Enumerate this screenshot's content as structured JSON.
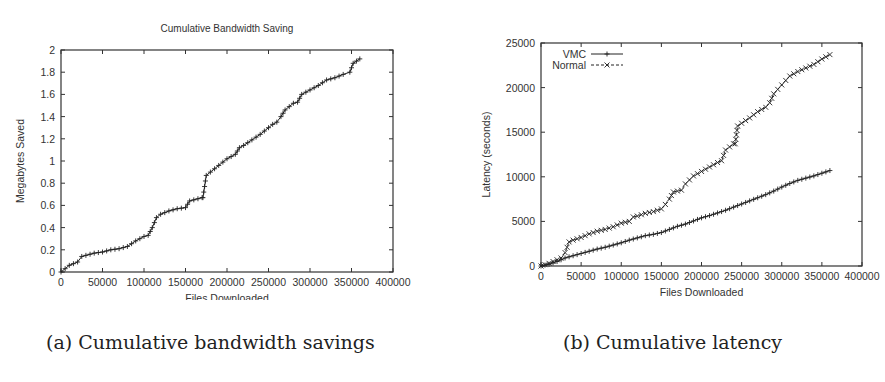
{
  "chart_data": [
    {
      "id": "a",
      "type": "line",
      "title": "Cumulative Bandwidth Saving",
      "xlabel": "Files Downloaded",
      "ylabel": "Megabytes Saved",
      "xlim": [
        0,
        400000
      ],
      "ylim": [
        0,
        2
      ],
      "xticks": [
        0,
        50000,
        100000,
        150000,
        200000,
        250000,
        300000,
        350000,
        400000
      ],
      "yticks": [
        0,
        0.2,
        0.4,
        0.6,
        0.8,
        1,
        1.2,
        1.4,
        1.6,
        1.8,
        2
      ],
      "ytick_labels": [
        "0",
        "0.2",
        "0.4",
        "0.6",
        "0.8",
        "1",
        "1.2",
        "1.4",
        "1.6",
        "1.8",
        "2"
      ],
      "grid": false,
      "legend": null,
      "series": [
        {
          "name": "Bandwidth Saved",
          "marker": "+",
          "dash": "solid",
          "x": [
            0,
            5000,
            10000,
            20000,
            25000,
            30000,
            40000,
            50000,
            60000,
            70000,
            80000,
            90000,
            100000,
            105000,
            110000,
            115000,
            120000,
            130000,
            140000,
            150000,
            155000,
            160000,
            170000,
            171000,
            175000,
            180000,
            190000,
            200000,
            210000,
            215000,
            220000,
            230000,
            240000,
            250000,
            255000,
            260000,
            265000,
            270000,
            280000,
            285000,
            290000,
            300000,
            310000,
            320000,
            330000,
            340000,
            348000,
            352000,
            360000
          ],
          "y": [
            0,
            0.03,
            0.06,
            0.09,
            0.14,
            0.15,
            0.17,
            0.18,
            0.2,
            0.21,
            0.23,
            0.28,
            0.32,
            0.33,
            0.4,
            0.49,
            0.52,
            0.55,
            0.57,
            0.58,
            0.64,
            0.65,
            0.67,
            0.67,
            0.87,
            0.9,
            0.96,
            1.02,
            1.06,
            1.12,
            1.14,
            1.19,
            1.24,
            1.3,
            1.33,
            1.35,
            1.4,
            1.46,
            1.52,
            1.53,
            1.6,
            1.64,
            1.68,
            1.73,
            1.75,
            1.78,
            1.8,
            1.88,
            1.92
          ]
        }
      ]
    },
    {
      "id": "b",
      "type": "line",
      "title": "",
      "xlabel": "Files Downloaded",
      "ylabel": "Latency (seconds)",
      "xlim": [
        0,
        400000
      ],
      "ylim": [
        0,
        25000
      ],
      "xticks": [
        0,
        50000,
        100000,
        150000,
        200000,
        250000,
        300000,
        350000,
        400000
      ],
      "yticks": [
        0,
        5000,
        10000,
        15000,
        20000,
        25000
      ],
      "ytick_labels": [
        "0",
        "5000",
        "10000",
        "15000",
        "20000",
        "25000"
      ],
      "grid": false,
      "legend": {
        "position": "upper left",
        "entries": [
          "VMC",
          "Normal"
        ]
      },
      "series": [
        {
          "name": "VMC",
          "marker": "+",
          "dash": "solid",
          "x": [
            0,
            10000,
            20000,
            30000,
            40000,
            50000,
            60000,
            70000,
            80000,
            90000,
            100000,
            110000,
            120000,
            130000,
            140000,
            150000,
            160000,
            170000,
            180000,
            190000,
            200000,
            210000,
            220000,
            230000,
            240000,
            250000,
            260000,
            270000,
            280000,
            290000,
            300000,
            310000,
            320000,
            330000,
            340000,
            350000,
            360000
          ],
          "y": [
            0,
            200,
            500,
            900,
            1150,
            1400,
            1650,
            1900,
            2100,
            2350,
            2600,
            2900,
            3150,
            3400,
            3550,
            3750,
            4100,
            4450,
            4700,
            5050,
            5400,
            5650,
            5950,
            6250,
            6600,
            6950,
            7300,
            7650,
            8000,
            8400,
            8850,
            9250,
            9600,
            9850,
            10100,
            10400,
            10700
          ]
        },
        {
          "name": "Normal",
          "marker": "x",
          "dash": "dashed",
          "x": [
            0,
            10000,
            20000,
            25000,
            30000,
            35000,
            40000,
            50000,
            60000,
            70000,
            80000,
            90000,
            100000,
            110000,
            115000,
            120000,
            130000,
            140000,
            150000,
            155000,
            160000,
            165000,
            170000,
            175000,
            180000,
            190000,
            200000,
            210000,
            220000,
            225000,
            230000,
            240000,
            242000,
            245000,
            250000,
            260000,
            270000,
            280000,
            285000,
            290000,
            295000,
            300000,
            310000,
            320000,
            330000,
            340000,
            350000,
            360000
          ],
          "y": [
            0,
            300,
            700,
            900,
            1500,
            2700,
            2900,
            3200,
            3600,
            3900,
            4100,
            4400,
            4800,
            5000,
            5500,
            5600,
            5900,
            6100,
            6400,
            6900,
            7500,
            8300,
            8400,
            8500,
            9200,
            10100,
            10600,
            11100,
            11600,
            11800,
            13000,
            13700,
            13700,
            15700,
            16000,
            16600,
            17300,
            17800,
            18300,
            19300,
            19800,
            20300,
            21300,
            21800,
            22200,
            22600,
            23200,
            23700
          ]
        }
      ]
    }
  ],
  "figures": {
    "a": {
      "title": "Cumulative Bandwidth Saving",
      "caption": "(a) Cumulative bandwidth savings"
    },
    "b": {
      "caption": "(b) Cumulative latency"
    }
  },
  "colors": {
    "line": "#222222",
    "axis": "#333333",
    "text": "#333333",
    "background": "#ffffff"
  }
}
